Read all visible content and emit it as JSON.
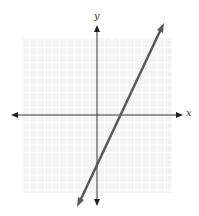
{
  "chart_data": {
    "type": "line",
    "title": "",
    "xlabel": "x",
    "ylabel": "y",
    "grid": true,
    "xlim": [
      -10,
      10
    ],
    "ylim": [
      -10,
      10
    ],
    "series": [
      {
        "name": "y = 2x - 6",
        "slope": 2,
        "intercept": -6,
        "x": [
          -1.5,
          8.8
        ],
        "y": [
          -9,
          11.6
        ],
        "arrows": "both"
      }
    ],
    "x_intercept": 3,
    "y_intercept": -6
  },
  "axes": {
    "x_label": "x",
    "y_label": "y"
  },
  "colors": {
    "grid": "#e6e6e6",
    "axis": "#333333",
    "line": "#555555",
    "background": "#ffffff"
  }
}
